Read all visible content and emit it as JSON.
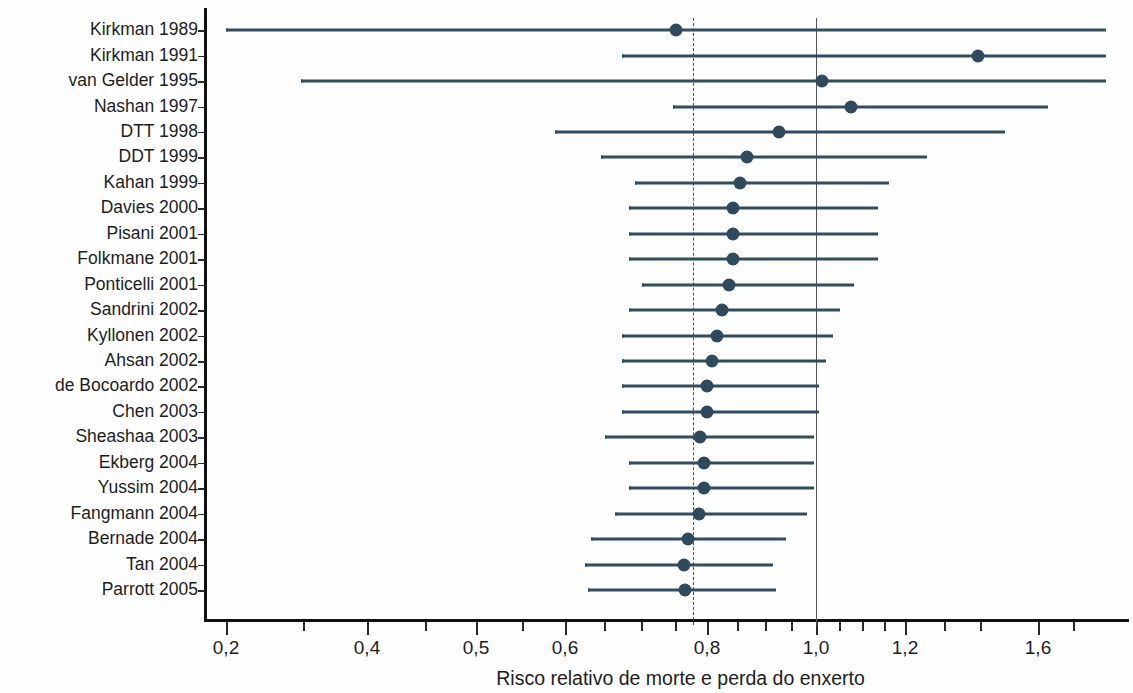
{
  "chart_data": {
    "type": "scatter",
    "subtype": "forest-plot",
    "title": "",
    "xlabel": "Risco relativo de morte e perda do enxerto",
    "ylabel": "",
    "xscale": "log",
    "grid": false,
    "legend": null,
    "xticks_labeled": [
      "0,2",
      "0,4",
      "0,5",
      "0,6",
      "0,8",
      "1,0",
      "1,2",
      "1,6"
    ],
    "xtick_values": [
      0.2,
      0.4,
      0.5,
      0.6,
      0.8,
      1.0,
      1.2,
      1.6
    ],
    "reference_lines": [
      {
        "name": "null-effect",
        "value": 1.0,
        "style": "solid"
      },
      {
        "name": "pooled-estimate",
        "value": 0.77,
        "style": "dashed"
      }
    ],
    "categories": [
      "Kirkman 1989",
      "Kirkman 1991",
      "van Gelder 1995",
      "Nashan 1997",
      "DTT 1998",
      "DDT 1999",
      "Kahan 1999",
      "Davies 2000",
      "Pisani 2001",
      "Folkmane 2001",
      "Ponticelli 2001",
      "Sandrini 2002",
      "Kyllonen 2002",
      "Ahsan 2002",
      "de Bocoardo 2002",
      "Chen 2003",
      "Sheashaa 2003",
      "Ekberg 2004",
      "Yussim 2004",
      "Fangmann 2004",
      "Bernade 2004",
      "Tan 2004",
      "Parrott 2005"
    ],
    "studies": [
      {
        "label": "Kirkman 1989",
        "rr": 0.76,
        "low": 0.2,
        "high": 1.77
      },
      {
        "label": "Kirkman 1991",
        "rr": 1.42,
        "low": 0.68,
        "high": 1.77
      },
      {
        "label": "van Gelder 1995",
        "rr": 1.02,
        "low": 0.3,
        "high": 1.77
      },
      {
        "label": "Nashan 1997",
        "rr": 1.09,
        "low": 0.75,
        "high": 1.6
      },
      {
        "label": "DTT 1998",
        "rr": 0.94,
        "low": 0.57,
        "high": 1.49
      },
      {
        "label": "DDT 1999",
        "rr": 0.88,
        "low": 0.61,
        "high": 1.22
      },
      {
        "label": "Kahan 1999",
        "rr": 0.87,
        "low": 0.66,
        "high": 1.15
      },
      {
        "label": "Davies 2000",
        "rr": 0.86,
        "low": 0.65,
        "high": 1.13
      },
      {
        "label": "Pisani 2001",
        "rr": 0.86,
        "low": 0.65,
        "high": 1.13
      },
      {
        "label": "Folkmane 2001",
        "rr": 0.86,
        "low": 0.65,
        "high": 1.13
      },
      {
        "label": "Ponticelli 2001",
        "rr": 0.85,
        "low": 0.67,
        "high": 1.07
      },
      {
        "label": "Sandrini 2002",
        "rr": 0.84,
        "low": 0.65,
        "high": 1.04
      },
      {
        "label": "Kyllonen 2002",
        "rr": 0.83,
        "low": 0.64,
        "high": 1.03
      },
      {
        "label": "Ahsan 2002",
        "rr": 0.82,
        "low": 0.64,
        "high": 1.02
      },
      {
        "label": "de Bocoardo 2002",
        "rr": 0.81,
        "low": 0.64,
        "high": 1.01
      },
      {
        "label": "Chen 2003",
        "rr": 0.81,
        "low": 0.64,
        "high": 1.01
      },
      {
        "label": "Sheashaa 2003",
        "rr": 0.8,
        "low": 0.62,
        "high": 1.0
      },
      {
        "label": "Ekberg 2004",
        "rr": 0.81,
        "low": 0.65,
        "high": 1.0
      },
      {
        "label": "Yussim 2004",
        "rr": 0.81,
        "low": 0.65,
        "high": 1.0
      },
      {
        "label": "Fangmann 2004",
        "rr": 0.8,
        "low": 0.63,
        "high": 0.99
      },
      {
        "label": "Bernade 2004",
        "rr": 0.78,
        "low": 0.62,
        "high": 0.96
      },
      {
        "label": "Tan 2004",
        "rr": 0.77,
        "low": 0.61,
        "high": 0.94
      },
      {
        "label": "Parrott 2005",
        "rr": 0.77,
        "low": 0.62,
        "high": 0.95
      }
    ],
    "colors": {
      "marker": "#2e4a5c",
      "line": "#314d60",
      "axis": "#111111",
      "reference": "#52565c"
    }
  },
  "geometry": {
    "plot_left": 205,
    "plot_right": 1106,
    "plot_top": 18,
    "plot_bottom": 619,
    "row_first_y": 30,
    "row_step": 25.3,
    "x_axis_ticks_px": [
      {
        "label": "0,2",
        "x": 226,
        "major": true
      },
      {
        "label": "",
        "x": 303,
        "major": false
      },
      {
        "label": "0,4",
        "x": 367,
        "major": true
      },
      {
        "label": "",
        "x": 425,
        "major": false
      },
      {
        "label": "0,5",
        "x": 476,
        "major": true
      },
      {
        "label": "",
        "x": 522,
        "major": false
      },
      {
        "label": "0,6",
        "x": 565,
        "major": true
      },
      {
        "label": "",
        "x": 604,
        "major": false
      },
      {
        "label": "",
        "x": 641,
        "major": false
      },
      {
        "label": "",
        "x": 675,
        "major": false
      },
      {
        "label": "0,8",
        "x": 707,
        "major": true
      },
      {
        "label": "",
        "x": 737,
        "major": false
      },
      {
        "label": "",
        "x": 765,
        "major": false
      },
      {
        "label": "",
        "x": 791,
        "major": false
      },
      {
        "label": "1,0",
        "x": 816,
        "major": true
      },
      {
        "label": "",
        "x": 839,
        "major": false
      },
      {
        "label": "",
        "x": 862,
        "major": false
      },
      {
        "label": "",
        "x": 884,
        "major": false
      },
      {
        "label": "1,2",
        "x": 905,
        "major": true
      },
      {
        "label": "",
        "x": 944,
        "major": false
      },
      {
        "label": "",
        "x": 980,
        "major": false
      },
      {
        "label": "1,6",
        "x": 1038,
        "major": true
      },
      {
        "label": "",
        "x": 1073,
        "major": false
      }
    ],
    "rows_px": [
      {
        "y": 30,
        "x_low": 226,
        "x_high": 1104,
        "x_est": 676
      },
      {
        "y": 55.5,
        "x_low": 622,
        "x_high": 1104,
        "x_est": 978
      },
      {
        "y": 81,
        "x_low": 301,
        "x_high": 1104,
        "x_est": 822
      },
      {
        "y": 106.5,
        "x_low": 673,
        "x_high": 1046,
        "x_est": 851
      },
      {
        "y": 131.5,
        "x_low": 555,
        "x_high": 1003,
        "x_est": 779
      },
      {
        "y": 157,
        "x_low": 601,
        "x_high": 925,
        "x_est": 747
      },
      {
        "y": 182.5,
        "x_low": 635,
        "x_high": 887,
        "x_est": 740
      },
      {
        "y": 208,
        "x_low": 629,
        "x_high": 876,
        "x_est": 733
      },
      {
        "y": 233.5,
        "x_low": 629,
        "x_high": 876,
        "x_est": 733
      },
      {
        "y": 259,
        "x_low": 629,
        "x_high": 876,
        "x_est": 733
      },
      {
        "y": 284.5,
        "x_low": 642,
        "x_high": 852,
        "x_est": 729
      },
      {
        "y": 310,
        "x_low": 629,
        "x_high": 838,
        "x_est": 722
      },
      {
        "y": 335.5,
        "x_low": 622,
        "x_high": 831,
        "x_est": 717
      },
      {
        "y": 361,
        "x_low": 622,
        "x_high": 824,
        "x_est": 712
      },
      {
        "y": 386,
        "x_low": 622,
        "x_high": 817,
        "x_est": 707
      },
      {
        "y": 411.5,
        "x_low": 622,
        "x_high": 817,
        "x_est": 707
      },
      {
        "y": 437,
        "x_low": 605,
        "x_high": 812,
        "x_est": 700
      },
      {
        "y": 462.5,
        "x_low": 629,
        "x_high": 812,
        "x_est": 704
      },
      {
        "y": 488,
        "x_low": 629,
        "x_high": 812,
        "x_est": 704
      },
      {
        "y": 513.5,
        "x_low": 615,
        "x_high": 805,
        "x_est": 699
      },
      {
        "y": 539,
        "x_low": 591,
        "x_high": 784,
        "x_est": 688
      },
      {
        "y": 564.5,
        "x_low": 585,
        "x_high": 771,
        "x_est": 684
      },
      {
        "y": 590,
        "x_low": 588,
        "x_high": 774,
        "x_est": 685
      }
    ],
    "ref_solid_x": 816,
    "ref_dashed_x": 693
  }
}
